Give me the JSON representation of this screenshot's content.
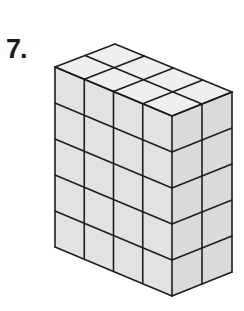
{
  "problem": {
    "number_label": "7."
  },
  "figure": {
    "type": "rectangular prism of unit cubes",
    "front_columns": 4,
    "side_columns": 2,
    "layers": 5,
    "colors": {
      "top_face": "#efefef",
      "front_face": "#e2e2e2",
      "side_face": "#dadada",
      "edge": "#1e1e1e"
    }
  }
}
